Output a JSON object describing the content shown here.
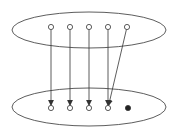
{
  "diagram": {
    "type": "mapping",
    "colors": {
      "stroke": "#333333",
      "fill_dot": "#222222",
      "background": "#ffffff"
    },
    "sets": [
      {
        "id": "top-set",
        "cx": 89,
        "cy": 30,
        "rx": 77,
        "ry": 18
      },
      {
        "id": "bottom-set",
        "cx": 89,
        "cy": 107,
        "rx": 77,
        "ry": 19
      }
    ],
    "top_nodes": [
      {
        "id": "a1",
        "x": 51,
        "y": 27,
        "filled": false
      },
      {
        "id": "a2",
        "x": 70,
        "y": 27,
        "filled": false
      },
      {
        "id": "a3",
        "x": 89,
        "y": 27,
        "filled": false
      },
      {
        "id": "a4",
        "x": 108,
        "y": 27,
        "filled": false
      },
      {
        "id": "a5",
        "x": 127,
        "y": 27,
        "filled": false
      }
    ],
    "bottom_nodes": [
      {
        "id": "b1",
        "x": 51,
        "y": 108,
        "filled": false
      },
      {
        "id": "b2",
        "x": 70,
        "y": 108,
        "filled": false
      },
      {
        "id": "b3",
        "x": 89,
        "y": 108,
        "filled": false
      },
      {
        "id": "b4",
        "x": 108,
        "y": 108,
        "filled": false
      },
      {
        "id": "b5",
        "x": 128,
        "y": 108,
        "filled": true
      }
    ],
    "edges": [
      {
        "from": "a1",
        "to": "b1"
      },
      {
        "from": "a2",
        "to": "b2"
      },
      {
        "from": "a3",
        "to": "b3"
      },
      {
        "from": "a4",
        "to": "b4"
      },
      {
        "from": "a5",
        "to": "b4"
      }
    ]
  }
}
